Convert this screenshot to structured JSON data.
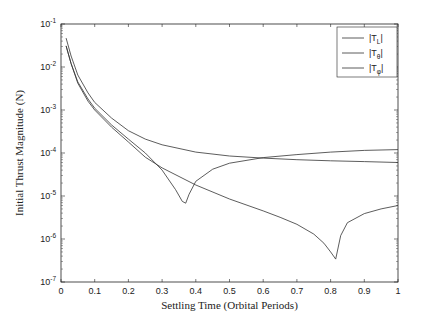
{
  "chart_data": {
    "type": "line",
    "title": "",
    "xlabel": "Settling Time (Orbital Periods)",
    "ylabel": "Initial Thrust Magnitude (N)",
    "xlim": [
      0,
      1
    ],
    "ylim": [
      1e-07,
      0.1
    ],
    "yscale": "log",
    "grid": false,
    "legend_position": "upper right",
    "x_ticks": [
      "0",
      "0.1",
      "0.2",
      "0.3",
      "0.4",
      "0.5",
      "0.6",
      "0.7",
      "0.8",
      "0.9",
      "1"
    ],
    "y_ticks": [
      {
        "base": "10",
        "exp": "-1"
      },
      {
        "base": "10",
        "exp": "-2"
      },
      {
        "base": "10",
        "exp": "-3"
      },
      {
        "base": "10",
        "exp": "-4"
      },
      {
        "base": "10",
        "exp": "-5"
      },
      {
        "base": "10",
        "exp": "-6"
      },
      {
        "base": "10",
        "exp": "-7"
      }
    ],
    "series": [
      {
        "name": "|T_L|",
        "legend_main": "|T",
        "legend_sub": "L",
        "legend_end": "|",
        "x": [
          0.015,
          0.03,
          0.05,
          0.08,
          0.1,
          0.15,
          0.2,
          0.25,
          0.3,
          0.34,
          0.36,
          0.37,
          0.38,
          0.4,
          0.45,
          0.5,
          0.6,
          0.7,
          0.8,
          0.9,
          1.0
        ],
        "y": [
          0.031,
          0.012,
          0.0045,
          0.0018,
          0.0011,
          0.00045,
          0.00021,
          0.0001,
          4e-05,
          1.4e-05,
          7.5e-06,
          6.8e-06,
          1.1e-05,
          2.2e-05,
          4.2e-05,
          5.8e-05,
          7.8e-05,
          9.2e-05,
          0.000105,
          0.000115,
          0.00012
        ]
      },
      {
        "name": "|T_θ|",
        "legend_main": "|T",
        "legend_sub": "θ",
        "legend_end": "|",
        "x": [
          0.015,
          0.03,
          0.05,
          0.08,
          0.1,
          0.15,
          0.2,
          0.25,
          0.3,
          0.4,
          0.5,
          0.6,
          0.7,
          0.8,
          0.9,
          1.0
        ],
        "y": [
          0.047,
          0.018,
          0.0065,
          0.0025,
          0.0015,
          0.00065,
          0.00033,
          0.00021,
          0.000155,
          0.000105,
          8.5e-05,
          7.6e-05,
          7e-05,
          6.6e-05,
          6.3e-05,
          6e-05
        ]
      },
      {
        "name": "|T_φ|",
        "legend_main": "|T",
        "legend_sub": "φ",
        "legend_end": "|",
        "x": [
          0.015,
          0.03,
          0.05,
          0.08,
          0.1,
          0.15,
          0.2,
          0.25,
          0.3,
          0.4,
          0.5,
          0.6,
          0.65,
          0.7,
          0.75,
          0.78,
          0.8,
          0.815,
          0.83,
          0.85,
          0.9,
          0.95,
          1.0
        ],
        "y": [
          0.031,
          0.012,
          0.0042,
          0.0016,
          0.001,
          0.0004,
          0.00018,
          8e-05,
          4.5e-05,
          1.8e-05,
          8.5e-06,
          4.5e-06,
          3.2e-06,
          2.2e-06,
          1.3e-06,
          8e-07,
          5e-07,
          3.4e-07,
          1.2e-06,
          2.4e-06,
          3.9e-06,
          5e-06,
          6e-06
        ]
      }
    ]
  }
}
